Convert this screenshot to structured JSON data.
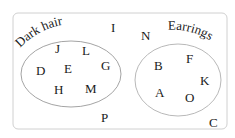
{
  "diagram": {
    "type": "venn",
    "sets": [
      {
        "label": "Dark hair",
        "members": [
          "J",
          "L",
          "D",
          "E",
          "G",
          "H",
          "M"
        ]
      },
      {
        "label": "Earrings",
        "members": [
          "B",
          "F",
          "A",
          "K",
          "O"
        ]
      }
    ],
    "outside": [
      "I",
      "N",
      "P",
      "C"
    ],
    "elements": {
      "J": "J",
      "L": "L",
      "D": "D",
      "E": "E",
      "G": "G",
      "H": "H",
      "M": "M",
      "B": "B",
      "F": "F",
      "A": "A",
      "K": "K",
      "O": "O",
      "I": "I",
      "N": "N",
      "P": "P",
      "C": "C"
    },
    "colors": {
      "border": "#c8c8c8",
      "ellipse": "#9a9a9a",
      "text": "#1a1a1a"
    }
  }
}
